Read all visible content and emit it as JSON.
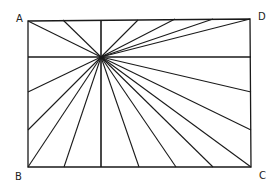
{
  "diagram": {
    "type": "hand-drawn rectangle with lines radiating from a point",
    "stroke_color": "#1a1a1a",
    "background": "#ffffff",
    "corners": {
      "A": {
        "label": "A",
        "x": 28,
        "y": 21
      },
      "D": {
        "label": "D",
        "x": 250,
        "y": 19
      },
      "B": {
        "label": "B",
        "x": 28,
        "y": 167
      },
      "C": {
        "label": "C",
        "x": 251,
        "y": 167
      }
    },
    "focus_point": {
      "x": 101,
      "y": 57
    },
    "ray_endpoints": [
      [
        28,
        21
      ],
      [
        63,
        20
      ],
      [
        101,
        20
      ],
      [
        138,
        20
      ],
      [
        175,
        19
      ],
      [
        213,
        19
      ],
      [
        250,
        19
      ],
      [
        251,
        57
      ],
      [
        251,
        92
      ],
      [
        251,
        130
      ],
      [
        251,
        167
      ],
      [
        213,
        167
      ],
      [
        176,
        167
      ],
      [
        139,
        167
      ],
      [
        101,
        167
      ],
      [
        64,
        167
      ],
      [
        28,
        167
      ],
      [
        28,
        130
      ],
      [
        28,
        92
      ],
      [
        28,
        57
      ]
    ],
    "labels": [
      {
        "text": "A",
        "x": 16,
        "y": 13
      },
      {
        "text": "D",
        "x": 258,
        "y": 11
      },
      {
        "text": "B",
        "x": 15,
        "y": 171
      },
      {
        "text": "C",
        "x": 259,
        "y": 170
      }
    ]
  }
}
